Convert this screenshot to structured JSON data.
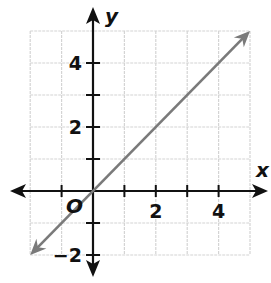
{
  "chart_data": {
    "type": "line",
    "title": "",
    "xlabel": "x",
    "ylabel": "y",
    "origin_label": "O",
    "xlim": [
      -2,
      5
    ],
    "ylim": [
      -2,
      5
    ],
    "grid": true,
    "x_ticks": [
      -1,
      1,
      2,
      3,
      4
    ],
    "y_ticks": [
      -2,
      -1,
      1,
      2,
      3,
      4
    ],
    "x_tick_labels": [
      {
        "value": 2,
        "label": "2"
      },
      {
        "value": 4,
        "label": "4"
      }
    ],
    "y_tick_labels": [
      {
        "value": 4,
        "label": "4"
      },
      {
        "value": 2,
        "label": "2"
      },
      {
        "value": -2,
        "label": "−2"
      }
    ],
    "series": [
      {
        "name": "y = x",
        "color": "#7a7a7a",
        "x": [
          -2,
          5
        ],
        "y": [
          -2,
          5
        ],
        "arrows": "both"
      }
    ],
    "legend": null
  },
  "colors": {
    "axis": "#111111",
    "grid": "#d4d4d4",
    "line": "#7a7a7a",
    "background": "#ffffff"
  }
}
